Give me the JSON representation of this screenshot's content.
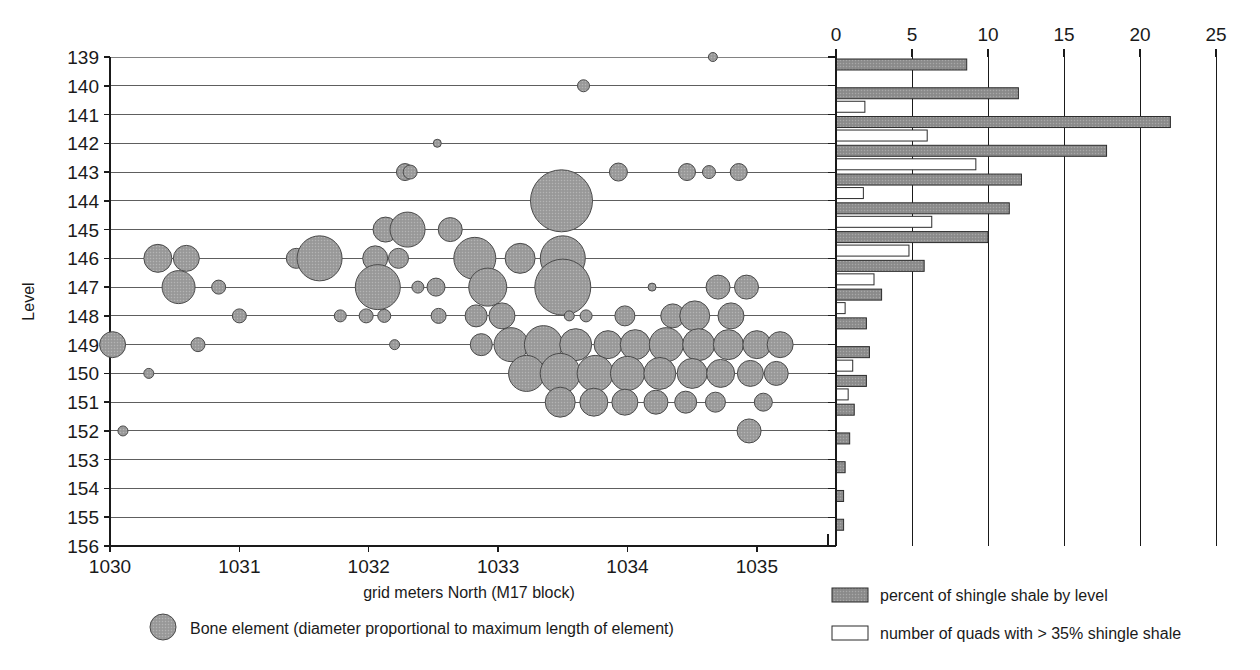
{
  "figure": {
    "background": "#ffffff",
    "bubble_fill": "#9d9d9d",
    "bubble_stroke": "#4a4a4a",
    "bar_fill_gray": "#8f8f8f",
    "bar_fill_white": "#ffffff",
    "bar_stroke": "#2b2b2b",
    "axis_color": "#1a1a1a",
    "grid_color": "#4d4d4d"
  },
  "scatter": {
    "ylabel": "Level",
    "xlabel": "grid meters North (M17 block)",
    "ytick_labels": [
      "139",
      "140",
      "141",
      "142",
      "143",
      "144",
      "145",
      "146",
      "147",
      "148",
      "149",
      "150",
      "151",
      "152",
      "153",
      "154",
      "155",
      "156"
    ],
    "xtick_labels": [
      "1030",
      "1031",
      "1032",
      "1033",
      "1034",
      "1035"
    ],
    "legend": {
      "marker": "bubble-marker",
      "label": "Bone element (diameter proportional to maximum length of element)"
    }
  },
  "bars": {
    "xtick_labels": [
      "0",
      "5",
      "10",
      "15",
      "20",
      "25"
    ],
    "legend": [
      {
        "swatch": "filled-gray-swatch",
        "label": "percent of shingle shale by level"
      },
      {
        "swatch": "outline-white-swatch",
        "label": "number of quads with > 35% shingle shale"
      }
    ]
  },
  "chart_data": {
    "type": "scatter",
    "title": "",
    "subtitle": "",
    "xlabel": "grid meters North (M17 block)",
    "ylabel": "Level",
    "xlim": [
      1030,
      1035.55
    ],
    "ylim": [
      139,
      156
    ],
    "y_inverted": true,
    "grid": "horizontal",
    "legend_position": "below-left",
    "xticks": [
      1030,
      1031,
      1032,
      1033,
      1034,
      1035
    ],
    "yticks": [
      139,
      140,
      141,
      142,
      143,
      144,
      145,
      146,
      147,
      148,
      149,
      150,
      151,
      152,
      153,
      154,
      155,
      156
    ],
    "series": [
      {
        "name": "Bone element (diameter proportional to maximum length of element)",
        "marker": "circle",
        "size_meaning": "diameter proportional to maximum length of element",
        "points": [
          {
            "x": 1034.66,
            "y": 139.0,
            "d": 9
          },
          {
            "x": 1033.66,
            "y": 140.0,
            "d": 12
          },
          {
            "x": 1032.53,
            "y": 142.0,
            "d": 8
          },
          {
            "x": 1032.28,
            "y": 143.0,
            "d": 17
          },
          {
            "x": 1032.32,
            "y": 143.0,
            "d": 14
          },
          {
            "x": 1033.93,
            "y": 143.0,
            "d": 18
          },
          {
            "x": 1034.46,
            "y": 143.0,
            "d": 17
          },
          {
            "x": 1034.63,
            "y": 143.0,
            "d": 13
          },
          {
            "x": 1034.86,
            "y": 143.0,
            "d": 17
          },
          {
            "x": 1033.49,
            "y": 144.0,
            "d": 62
          },
          {
            "x": 1032.13,
            "y": 145.0,
            "d": 25
          },
          {
            "x": 1032.3,
            "y": 145.0,
            "d": 35
          },
          {
            "x": 1032.63,
            "y": 145.0,
            "d": 24
          },
          {
            "x": 1030.37,
            "y": 146.0,
            "d": 28
          },
          {
            "x": 1030.59,
            "y": 146.0,
            "d": 26
          },
          {
            "x": 1031.44,
            "y": 146.0,
            "d": 20
          },
          {
            "x": 1031.62,
            "y": 146.0,
            "d": 45
          },
          {
            "x": 1032.05,
            "y": 146.0,
            "d": 25
          },
          {
            "x": 1032.23,
            "y": 146.0,
            "d": 20
          },
          {
            "x": 1032.82,
            "y": 146.0,
            "d": 42
          },
          {
            "x": 1033.17,
            "y": 146.0,
            "d": 30
          },
          {
            "x": 1033.5,
            "y": 146.0,
            "d": 45
          },
          {
            "x": 1030.53,
            "y": 147.0,
            "d": 33
          },
          {
            "x": 1030.84,
            "y": 147.0,
            "d": 14
          },
          {
            "x": 1032.07,
            "y": 147.0,
            "d": 45
          },
          {
            "x": 1032.38,
            "y": 147.0,
            "d": 12
          },
          {
            "x": 1032.52,
            "y": 147.0,
            "d": 18
          },
          {
            "x": 1032.92,
            "y": 147.0,
            "d": 38
          },
          {
            "x": 1033.5,
            "y": 147.0,
            "d": 56
          },
          {
            "x": 1034.19,
            "y": 147.0,
            "d": 8
          },
          {
            "x": 1034.7,
            "y": 147.0,
            "d": 24
          },
          {
            "x": 1034.92,
            "y": 147.0,
            "d": 24
          },
          {
            "x": 1031.0,
            "y": 148.0,
            "d": 14
          },
          {
            "x": 1031.78,
            "y": 148.0,
            "d": 12
          },
          {
            "x": 1031.98,
            "y": 148.0,
            "d": 14
          },
          {
            "x": 1032.12,
            "y": 148.0,
            "d": 13
          },
          {
            "x": 1032.54,
            "y": 148.0,
            "d": 15
          },
          {
            "x": 1032.83,
            "y": 148.0,
            "d": 22
          },
          {
            "x": 1033.03,
            "y": 148.0,
            "d": 26
          },
          {
            "x": 1033.55,
            "y": 148.0,
            "d": 10
          },
          {
            "x": 1033.68,
            "y": 148.0,
            "d": 12
          },
          {
            "x": 1033.98,
            "y": 148.0,
            "d": 20
          },
          {
            "x": 1034.35,
            "y": 148.0,
            "d": 24
          },
          {
            "x": 1034.52,
            "y": 148.0,
            "d": 30
          },
          {
            "x": 1034.8,
            "y": 148.0,
            "d": 26
          },
          {
            "x": 1030.02,
            "y": 149.0,
            "d": 26
          },
          {
            "x": 1030.68,
            "y": 149.0,
            "d": 14
          },
          {
            "x": 1032.2,
            "y": 149.0,
            "d": 10
          },
          {
            "x": 1032.87,
            "y": 149.0,
            "d": 22
          },
          {
            "x": 1033.1,
            "y": 149.0,
            "d": 34
          },
          {
            "x": 1033.35,
            "y": 149.0,
            "d": 38
          },
          {
            "x": 1033.6,
            "y": 149.0,
            "d": 32
          },
          {
            "x": 1033.85,
            "y": 149.0,
            "d": 28
          },
          {
            "x": 1034.06,
            "y": 149.0,
            "d": 30
          },
          {
            "x": 1034.3,
            "y": 149.0,
            "d": 34
          },
          {
            "x": 1034.55,
            "y": 149.0,
            "d": 32
          },
          {
            "x": 1034.78,
            "y": 149.0,
            "d": 30
          },
          {
            "x": 1035.0,
            "y": 149.0,
            "d": 28
          },
          {
            "x": 1035.18,
            "y": 149.0,
            "d": 26
          },
          {
            "x": 1030.3,
            "y": 150.0,
            "d": 10
          },
          {
            "x": 1033.22,
            "y": 150.0,
            "d": 36
          },
          {
            "x": 1033.48,
            "y": 150.0,
            "d": 40
          },
          {
            "x": 1033.75,
            "y": 150.0,
            "d": 36
          },
          {
            "x": 1034.0,
            "y": 150.0,
            "d": 34
          },
          {
            "x": 1034.25,
            "y": 150.0,
            "d": 32
          },
          {
            "x": 1034.5,
            "y": 150.0,
            "d": 30
          },
          {
            "x": 1034.72,
            "y": 150.0,
            "d": 28
          },
          {
            "x": 1034.95,
            "y": 150.0,
            "d": 26
          },
          {
            "x": 1035.15,
            "y": 150.0,
            "d": 24
          },
          {
            "x": 1033.48,
            "y": 151.0,
            "d": 30
          },
          {
            "x": 1033.74,
            "y": 151.0,
            "d": 28
          },
          {
            "x": 1033.98,
            "y": 151.0,
            "d": 26
          },
          {
            "x": 1034.22,
            "y": 151.0,
            "d": 24
          },
          {
            "x": 1034.45,
            "y": 151.0,
            "d": 22
          },
          {
            "x": 1034.68,
            "y": 151.0,
            "d": 20
          },
          {
            "x": 1035.05,
            "y": 151.0,
            "d": 18
          },
          {
            "x": 1030.1,
            "y": 152.0,
            "d": 10
          },
          {
            "x": 1034.94,
            "y": 152.0,
            "d": 24
          }
        ]
      }
    ],
    "companion_chart": {
      "type": "bar",
      "orientation": "horizontal",
      "xlabel": "",
      "ylabel": "Level",
      "xlim": [
        0,
        25.6
      ],
      "xticks": [
        0,
        5,
        10,
        15,
        20,
        25
      ],
      "grid": "vertical",
      "categories": [
        "139",
        "140",
        "141",
        "142",
        "143",
        "144",
        "145",
        "146",
        "147",
        "148",
        "149",
        "150",
        "151",
        "152",
        "153",
        "154",
        "155"
      ],
      "series": [
        {
          "name": "percent of shingle shale by level",
          "fill": "#8f8f8f",
          "values": [
            8.6,
            12.0,
            22.0,
            17.8,
            12.2,
            11.4,
            10.0,
            5.8,
            3.0,
            2.0,
            2.2,
            2.0,
            1.2,
            0.9,
            0.6,
            0.5,
            0.5
          ]
        },
        {
          "name": "number of quads with > 35% shingle shale",
          "fill": "#ffffff",
          "values": [
            0.0,
            1.9,
            6.0,
            9.2,
            1.8,
            6.3,
            4.8,
            2.5,
            0.6,
            0.0,
            1.1,
            0.8,
            0.0,
            0.0,
            0.0,
            0.0,
            0.0
          ]
        }
      ]
    }
  }
}
